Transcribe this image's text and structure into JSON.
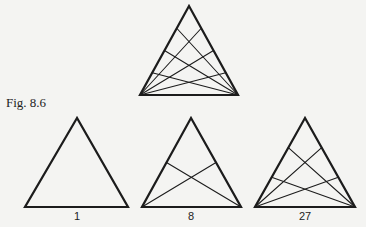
{
  "caption": "Fig. 8.6",
  "colors": {
    "stroke": "#1c1c1c",
    "background": "#f4f4f2"
  },
  "triangles": [
    {
      "id": "top",
      "apex": [
        189,
        6
      ],
      "left": [
        140,
        95
      ],
      "right": [
        238,
        95
      ],
      "divisions": 4,
      "label": ""
    },
    {
      "id": "one",
      "apex": [
        77,
        118
      ],
      "left": [
        25,
        207
      ],
      "right": [
        128,
        207
      ],
      "divisions": 1,
      "label": "1"
    },
    {
      "id": "eight",
      "apex": [
        191,
        118
      ],
      "left": [
        142,
        207
      ],
      "right": [
        241,
        207
      ],
      "divisions": 2,
      "label": "8"
    },
    {
      "id": "twentyseven",
      "apex": [
        305,
        118
      ],
      "left": [
        255,
        207
      ],
      "right": [
        355,
        207
      ],
      "divisions": 3,
      "label": "27"
    }
  ],
  "labels": {
    "one": "1",
    "eight": "8",
    "twentyseven": "27"
  }
}
